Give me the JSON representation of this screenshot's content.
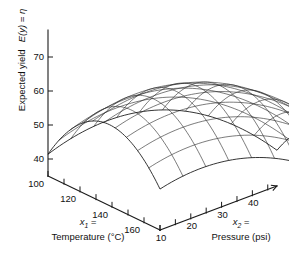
{
  "figure": {
    "kind": "3d-response-surface-plot",
    "background_color": "#ffffff",
    "line_color": "#1a1a1a"
  },
  "yaxis": {
    "label_prefix": "Expected yield",
    "label_equation": "E(y) = η",
    "ticks": [
      40,
      50,
      60,
      70
    ],
    "range": [
      35,
      75
    ]
  },
  "x1axis": {
    "var_name": "x",
    "var_sub": "1",
    "label_line1": "x1 =",
    "label_line2": "Temperature (°C)",
    "unit": "°C",
    "quantity": "Temperature",
    "ticks": [
      100,
      120,
      140,
      160
    ],
    "minor_ticks": [
      110,
      130,
      150,
      170
    ],
    "range": [
      100,
      170
    ]
  },
  "x2axis": {
    "var_name": "x",
    "var_sub": "2",
    "label_line1": "x2 =",
    "label_line2": "Pressure (psi)",
    "unit": "psi",
    "quantity": "Pressure",
    "ticks": [
      10,
      20,
      30,
      40
    ],
    "minor_ticks": [
      15,
      25,
      35,
      45
    ],
    "range": [
      10,
      48
    ]
  },
  "chart_data": {
    "type": "surface",
    "title": "",
    "xlabel": "x1 = Temperature (°C)",
    "ylabel": "x2 = Pressure (psi)",
    "zlabel": "Expected yield  E(y) = η",
    "xlim": [
      100,
      170
    ],
    "ylim": [
      10,
      48
    ],
    "zlim": [
      35,
      75
    ],
    "grid": false,
    "legend": "none",
    "x_tick_labels": [
      "100",
      "120",
      "140",
      "160"
    ],
    "y_tick_labels": [
      "10",
      "20",
      "30",
      "40"
    ],
    "z_tick_labels": [
      "40",
      "50",
      "60",
      "70"
    ],
    "surface_model": {
      "form": "quadratic_response_surface",
      "equation": "eta = 71.2 - 0.0118*(x1-136)^2 - 0.0345*(x2-29)^2 - 0.0030*(x1-136)*(x2-29)",
      "peak_value": 71.2,
      "peak_x1": 136,
      "peak_x2": 29,
      "corner_values": {
        "x1_100_x2_10": 44.0,
        "x1_100_x2_48": 43.5,
        "x1_170_x2_10": 44.0,
        "x1_170_x2_48": 43.0
      },
      "mesh_lines_x1": 11,
      "mesh_lines_x2": 11
    },
    "z_contour_levels": [
      40,
      50,
      60,
      70
    ]
  },
  "projection": {
    "origin_px": [
      48,
      176
    ],
    "x1_end_px": [
      160,
      230
    ],
    "x2_end_px": [
      277,
      186
    ],
    "z_top_px": [
      48,
      30
    ],
    "z_unit_px_per_value": 3.4
  }
}
